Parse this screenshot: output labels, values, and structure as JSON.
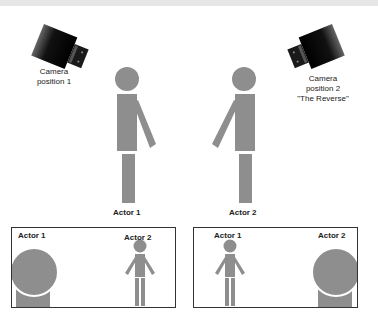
{
  "colors": {
    "figure": "#8e8e8e",
    "camera": "#111111",
    "frame_border": "#333333",
    "top_band": "#e6e6e6"
  },
  "cameras": [
    {
      "id": "camera-1",
      "label_line1": "Camera",
      "label_line2": "position 1",
      "label_line3": ""
    },
    {
      "id": "camera-2",
      "label_line1": "Camera",
      "label_line2": "position 2",
      "label_line3": "\"The Reverse\""
    }
  ],
  "actors": [
    {
      "id": "actor-1",
      "label": "Actor 1"
    },
    {
      "id": "actor-2",
      "label": "Actor 2"
    }
  ],
  "frames": [
    {
      "id": "frame-camera-1",
      "foreground_label": "Actor 1",
      "background_label": "Actor 2"
    },
    {
      "id": "frame-camera-2",
      "foreground_label": "Actor 2",
      "background_label": "Actor 1"
    }
  ]
}
